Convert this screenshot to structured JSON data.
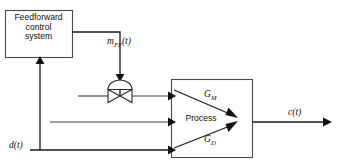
{
  "diagram": {
    "background_color": "#ffffff",
    "line_color": "#1a1a1a",
    "blocks": [
      {
        "id": "feedforward-controller",
        "label": "Feedforward control system",
        "label_lines": [
          "Feedforward",
          "control",
          "system"
        ],
        "x": 5,
        "y": 10,
        "w": 67,
        "h": 47
      },
      {
        "id": "process",
        "label": "Process",
        "x": 171,
        "y": 79,
        "w": 81,
        "h": 79
      }
    ],
    "signals": {
      "manipulated_feedforward": "m",
      "manipulated_feedforward_sub": "FF",
      "manipulated_feedforward_arg": "(t)",
      "disturbance": "d",
      "disturbance_arg": "(t)",
      "controlled": "c",
      "controlled_arg": "(t)"
    },
    "transfer_functions": [
      {
        "id": "gm",
        "symbol": "G",
        "subscript": "M",
        "meaning": "manipulated-variable process transfer function"
      },
      {
        "id": "gd",
        "symbol": "G",
        "subscript": "D",
        "meaning": "disturbance process transfer function"
      }
    ],
    "elements": [
      {
        "id": "control-valve",
        "name": "control-valve-icon",
        "cx": 120,
        "cy": 96
      }
    ]
  }
}
